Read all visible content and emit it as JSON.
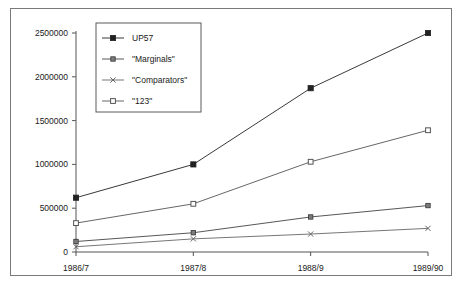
{
  "chart_data": {
    "type": "line",
    "title": "",
    "xlabel": "",
    "ylabel": "",
    "categories": [
      "1986/7",
      "1987/8",
      "1988/9",
      "1989/90"
    ],
    "ylim": [
      0,
      2500000
    ],
    "yticks": [
      0,
      500000,
      1000000,
      1500000,
      2000000,
      2500000
    ],
    "ytick_labels": [
      "0",
      "500000",
      "1000000",
      "1500000",
      "2000000",
      "2500000"
    ],
    "grid": false,
    "legend_position": "top-left-inside",
    "series": [
      {
        "name": "UP57",
        "marker": "filled-square",
        "color": "#222222",
        "values": [
          620000,
          1000000,
          1870000,
          2500000
        ]
      },
      {
        "name": "\"Marginals\"",
        "marker": "small-square",
        "color": "#444444",
        "values": [
          120000,
          220000,
          400000,
          530000
        ]
      },
      {
        "name": "\"Comparators\"",
        "marker": "x-cross",
        "color": "#666666",
        "values": [
          60000,
          150000,
          205000,
          270000
        ]
      },
      {
        "name": "\"123\"",
        "marker": "open-square",
        "color": "#555555",
        "values": [
          330000,
          550000,
          1030000,
          1390000
        ]
      }
    ]
  },
  "legend": {
    "entries": [
      {
        "label": "UP57"
      },
      {
        "label": "\"Marginals\""
      },
      {
        "label": "\"Comparators\""
      },
      {
        "label": "\"123\""
      }
    ]
  }
}
